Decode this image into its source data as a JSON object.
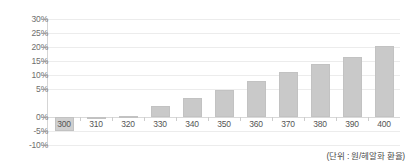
{
  "chart_data": {
    "type": "bar",
    "title": "",
    "xlabel": "",
    "ylabel": "",
    "caption": "(단위 : 원/헤알화 환율)",
    "categories": [
      "300",
      "310",
      "320",
      "330",
      "340",
      "350",
      "360",
      "370",
      "380",
      "390",
      "400"
    ],
    "values": [
      -5.0,
      -0.2,
      0.5,
      4.0,
      6.8,
      9.8,
      13.0,
      16.0,
      19.0,
      21.5,
      25.5
    ],
    "y_tick_labels": [
      "30%",
      "25%",
      "20%",
      "15%",
      "10%",
      "5%",
      "0%",
      "-5%",
      "-10%"
    ],
    "y_tick_values": [
      30,
      25,
      20,
      15,
      10,
      5,
      0,
      -5,
      -10
    ],
    "ylim": [
      -10,
      30
    ],
    "grid": true,
    "legend": false,
    "bar_color": "#c9c9c9",
    "grid_color": "#ececec",
    "axis_color": "#d5d5d5",
    "label_color": "#6e6e6e"
  }
}
